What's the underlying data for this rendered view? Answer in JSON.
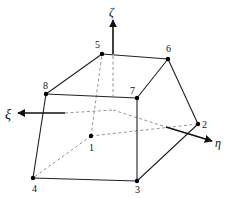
{
  "diagram": {
    "axes": {
      "zeta": {
        "label": "ζ"
      },
      "xi": {
        "label": "ξ"
      },
      "eta": {
        "label": "η"
      }
    },
    "nodes": [
      {
        "id": "1",
        "label": "1",
        "x": 91,
        "y": 136
      },
      {
        "id": "2",
        "label": "2",
        "x": 198,
        "y": 124
      },
      {
        "id": "3",
        "label": "3",
        "x": 137,
        "y": 181
      },
      {
        "id": "4",
        "label": "4",
        "x": 33,
        "y": 178
      },
      {
        "id": "5",
        "label": "5",
        "x": 102,
        "y": 54
      },
      {
        "id": "6",
        "label": "6",
        "x": 168,
        "y": 59
      },
      {
        "id": "7",
        "label": "7",
        "x": 137,
        "y": 98
      },
      {
        "id": "8",
        "label": "8",
        "x": 46,
        "y": 94
      }
    ],
    "visible_edges": [
      [
        "5",
        "6"
      ],
      [
        "5",
        "8"
      ],
      [
        "8",
        "7"
      ],
      [
        "6",
        "7"
      ],
      [
        "7",
        "3"
      ],
      [
        "8",
        "4"
      ],
      [
        "4",
        "3"
      ],
      [
        "3",
        "2"
      ],
      [
        "6",
        "2"
      ]
    ],
    "hidden_edges": [
      [
        "1",
        "2"
      ],
      [
        "1",
        "4"
      ],
      [
        "1",
        "5"
      ]
    ],
    "colors": {
      "line": "#222222",
      "hidden": "#888888",
      "background": "#ffffff"
    }
  }
}
